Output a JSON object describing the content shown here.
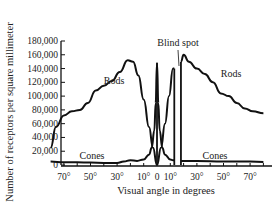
{
  "chart_data": {
    "type": "line",
    "title": "",
    "xlabel": "Visual angle in degrees",
    "ylabel": "Number of receptors per square millimeter",
    "xlim": [
      -80,
      80
    ],
    "ylim": [
      0,
      180000
    ],
    "x_tick_labels": [
      "70°",
      "50°",
      "30°",
      "10°",
      "0",
      "10°",
      "30°",
      "50°",
      "70°"
    ],
    "x_tick_values": [
      -70,
      -50,
      -30,
      -10,
      0,
      10,
      30,
      50,
      70
    ],
    "y_tick_labels": [
      "0",
      "20,000",
      "40,000",
      "60,000",
      "80,000",
      "100,000",
      "120,000",
      "140,000",
      "160,000",
      "180,000"
    ],
    "y_tick_values": [
      0,
      20000,
      40000,
      60000,
      80000,
      100000,
      120000,
      140000,
      160000,
      180000
    ],
    "grid": false,
    "legend": "none (inline labels)",
    "annotations": [
      {
        "text": "Rods",
        "near_x": -25,
        "near_y": 120000
      },
      {
        "text": "Rods",
        "near_x": 55,
        "near_y": 120000
      },
      {
        "text": "Cones",
        "near_x": -55,
        "near_y": 10000
      },
      {
        "text": "Cones",
        "near_x": 45,
        "near_y": 10000
      },
      {
        "text": "Blind spot",
        "near_x": 15,
        "near_y": 170000
      }
    ],
    "blind_spot_range": [
      13,
      18
    ],
    "series": [
      {
        "name": "Rods",
        "x": [
          -80,
          -76,
          -70,
          -64,
          -58,
          -52,
          -46,
          -40,
          -34,
          -28,
          -22,
          -18,
          -14,
          -10,
          -6,
          -3,
          0,
          3,
          6,
          9,
          12,
          13,
          18,
          20,
          24,
          30,
          36,
          42,
          48,
          54,
          60,
          66,
          72,
          80
        ],
        "values": [
          25000,
          55000,
          72000,
          78000,
          80000,
          90000,
          108000,
          115000,
          122000,
          135000,
          152000,
          150000,
          130000,
          95000,
          55000,
          25000,
          0,
          25000,
          60000,
          100000,
          140000,
          140000,
          150000,
          160000,
          150000,
          140000,
          132000,
          120000,
          104000,
          100000,
          90000,
          82000,
          78000,
          75000
        ]
      },
      {
        "name": "Cones",
        "x": [
          -80,
          -70,
          -60,
          -50,
          -40,
          -30,
          -25,
          -20,
          -15,
          -10,
          -6,
          -4,
          -2,
          -1,
          0,
          1,
          2,
          4,
          6,
          10,
          12,
          13,
          18,
          30,
          50,
          70,
          80
        ],
        "values": [
          5000,
          4000,
          4000,
          3500,
          3000,
          3000,
          5000,
          7000,
          6000,
          8000,
          15000,
          25000,
          50000,
          90000,
          148000,
          90000,
          50000,
          25000,
          15000,
          8000,
          7000,
          7000,
          6000,
          6000,
          5000,
          5000,
          4500
        ]
      }
    ]
  }
}
